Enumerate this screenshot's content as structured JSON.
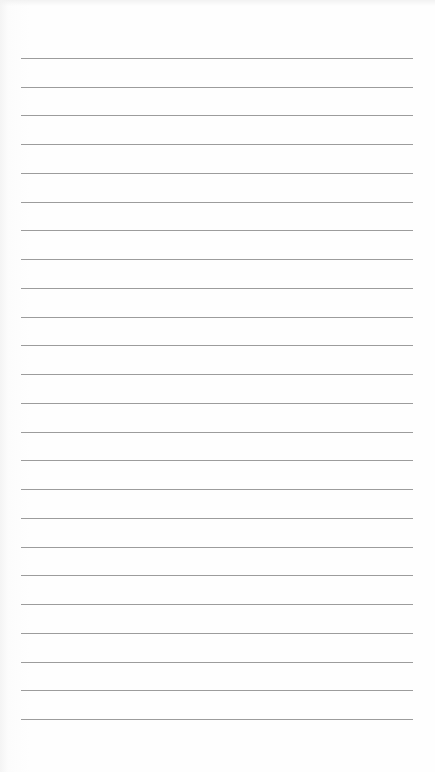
{
  "page": {
    "type": "lined-notebook-paper",
    "background_color": "#fdfdfd",
    "line_color": "#9c9c9c",
    "line_count": 24,
    "line_left": 21,
    "line_right": 413,
    "first_line_y": 58,
    "line_spacing": 28.74
  }
}
